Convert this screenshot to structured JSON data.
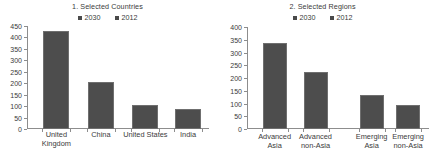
{
  "chart_data": [
    {
      "type": "bar",
      "panel_number": "1.",
      "title": "1. Selected Countries",
      "categories": [
        "United Kingdom",
        "China",
        "United States",
        "India"
      ],
      "category_lines": [
        [
          "United",
          "Kingdom"
        ],
        [
          "China"
        ],
        [
          "United States"
        ],
        [
          "India"
        ]
      ],
      "values": [
        428,
        205,
        105,
        88
      ],
      "series": [
        {
          "name": "2030",
          "values": [
            428,
            205,
            105,
            88
          ]
        },
        {
          "name": "2012",
          "values": [
            null,
            null,
            null,
            null
          ]
        }
      ],
      "legend": [
        "2030",
        "2012"
      ],
      "legend_position": "top-center",
      "xlabel": "",
      "ylabel": "",
      "ylim": [
        0,
        450
      ],
      "yticks": [
        0,
        50,
        100,
        150,
        200,
        250,
        300,
        350,
        400,
        450
      ],
      "ytick_labels": [
        "0",
        "50",
        "100",
        "150",
        "200",
        "250",
        "300",
        "350",
        "400",
        "450"
      ],
      "grid": false,
      "bar_color": "#4d4d4d"
    },
    {
      "type": "bar",
      "panel_number": "2.",
      "title": "2. Selected Regions",
      "categories": [
        "Advanced Asia",
        "Advanced non-Asia",
        "Emerging Asia",
        "Emerging non-Asia"
      ],
      "category_lines": [
        [
          "Advanced",
          "Asia"
        ],
        [
          "Advanced",
          "non-Asia"
        ],
        [
          "Emerging",
          "Asia"
        ],
        [
          "Emerging",
          "non-Asia"
        ]
      ],
      "values": [
        337,
        224,
        133,
        94
      ],
      "series": [
        {
          "name": "2030",
          "values": [
            337,
            224,
            133,
            94
          ]
        },
        {
          "name": "2012",
          "values": [
            null,
            null,
            null,
            null
          ]
        }
      ],
      "legend": [
        "2030",
        "2012"
      ],
      "legend_position": "top-center",
      "xlabel": "",
      "ylabel": "",
      "ylim": [
        0,
        400
      ],
      "yticks": [
        0,
        50,
        100,
        150,
        200,
        250,
        300,
        350,
        400
      ],
      "ytick_labels": [
        "0",
        "50",
        "100",
        "150",
        "200",
        "250",
        "300",
        "350",
        "400"
      ],
      "grid": false,
      "bar_color": "#4d4d4d"
    }
  ],
  "colors": {
    "bar": "#4d4d4d",
    "bar_edge": "#6f6f6f",
    "axis": "#8d8d8d",
    "text": "#3a3a3a",
    "background": "#ffffff"
  }
}
